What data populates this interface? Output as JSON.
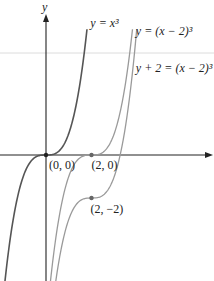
{
  "chart_data": {
    "type": "line",
    "title": "",
    "xlabel": "",
    "ylabel": "y",
    "axes": {
      "x_arrow": true,
      "y_arrow": true,
      "grid": false,
      "ticks": false
    },
    "xlim": [
      -2.0,
      7.3
    ],
    "ylim": [
      -5.8,
      6.5
    ],
    "series": [
      {
        "name": "y = x^3",
        "label": "y = x³",
        "shift_x": 0,
        "shift_y": 0,
        "color": "#555555",
        "width": 1.6,
        "label_pos": {
          "x": 1.95,
          "y": 5.95
        }
      },
      {
        "name": "y = (x - 2)^3",
        "label": "y = (x − 2)³",
        "shift_x": 2,
        "shift_y": 0,
        "color": "#9a9a9a",
        "width": 1.3,
        "label_pos": {
          "x": 3.95,
          "y": 5.6
        }
      },
      {
        "name": "y + 2 = (x - 2)^3",
        "label": "y + 2 = (x − 2)³",
        "shift_x": 2,
        "shift_y": -2,
        "color": "#9a9a9a",
        "width": 1.3,
        "label_pos": {
          "x": 3.95,
          "y": 3.85
        }
      }
    ],
    "points": [
      {
        "x": 0,
        "y": 0,
        "label": "(0, 0)",
        "color": "#222222"
      },
      {
        "x": 2,
        "y": 0,
        "label": "(2, 0)",
        "color": "#666666"
      },
      {
        "x": 2,
        "y": -2,
        "label": "(2, −2)",
        "color": "#666666"
      }
    ],
    "annotations": [
      "y = x³",
      "y = (x − 2)³",
      "y + 2 = (x − 2)³",
      "(0, 0)",
      "(2, 0)",
      "(2, −2)"
    ]
  },
  "axis": {
    "y_label": "y"
  }
}
